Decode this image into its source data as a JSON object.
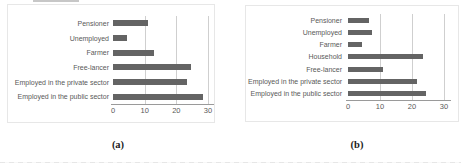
{
  "chart_data": [
    {
      "type": "bar",
      "orientation": "horizontal",
      "caption": "(a)",
      "title": "",
      "xlabel": "",
      "ylabel": "",
      "categories": [
        "Pensioner",
        "Unemployed",
        "Farmer",
        "Free-lancer",
        "Employed in the private sector",
        "Employed in the public sector"
      ],
      "values": [
        11,
        4.5,
        13,
        24.5,
        23.5,
        28.5
      ],
      "xlim": [
        0,
        30
      ],
      "xticks": [
        0,
        10,
        20,
        30
      ],
      "grid": true,
      "legend": false,
      "bar_color": "#646464",
      "label_color": "#595959"
    },
    {
      "type": "bar",
      "orientation": "horizontal",
      "caption": "(b)",
      "title": "",
      "xlabel": "",
      "ylabel": "",
      "categories": [
        "Pensioner",
        "Unemployed",
        "Farmer",
        "Household",
        "Free-lancer",
        "Employed in the private sector",
        "Employed in the public sector"
      ],
      "values": [
        6.5,
        7.5,
        4.5,
        23.5,
        11,
        21.5,
        24.5
      ],
      "xlim": [
        0,
        30
      ],
      "xticks": [
        0,
        10,
        20,
        30
      ],
      "grid": true,
      "legend": false,
      "bar_color": "#646464",
      "label_color": "#595959"
    }
  ]
}
